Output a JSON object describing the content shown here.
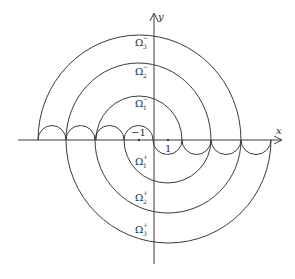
{
  "diagram": {
    "axes": {
      "x_label": "x",
      "y_label": "y",
      "tick_labels": {
        "neg_one": "−1",
        "one": "1"
      }
    },
    "regions_upper": [
      {
        "name": "Ω",
        "sub": "1",
        "sup": "−"
      },
      {
        "name": "Ω",
        "sub": "2",
        "sup": "−"
      },
      {
        "name": "Ω",
        "sub": "3",
        "sup": "−"
      }
    ],
    "regions_lower": [
      {
        "name": "Ω",
        "sub": "1",
        "sup": "+"
      },
      {
        "name": "Ω",
        "sub": "2",
        "sup": "+"
      },
      {
        "name": "Ω",
        "sub": "3",
        "sup": "+"
      }
    ],
    "stroke_color": "#3a3a3a"
  }
}
